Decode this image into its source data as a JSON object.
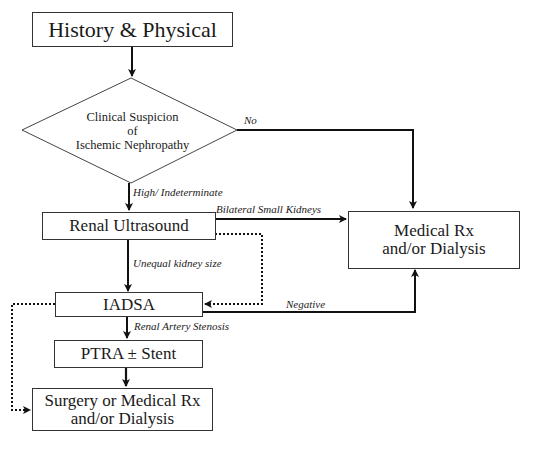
{
  "nodes": {
    "history": "History & Physical",
    "decision_line1": "Clinical Suspicion",
    "decision_line2": "of",
    "decision_line3": "Ischemic Nephropathy",
    "ultrasound": "Renal Ultrasound",
    "medical_line1": "Medical Rx",
    "medical_line2": "and/or Dialysis",
    "iadsa": "IADSA",
    "ptra": "PTRA ± Stent",
    "surgery_line1": "Surgery or Medical Rx",
    "surgery_line2": "and/or Dialysis"
  },
  "edges": {
    "no": "No",
    "high": "High/ Indeterminate",
    "bilateral": "Bilateral Small Kidneys",
    "unequal": "Unequal kidney size",
    "negative": "Negative",
    "ras": "Renal Artery Stenosis"
  }
}
